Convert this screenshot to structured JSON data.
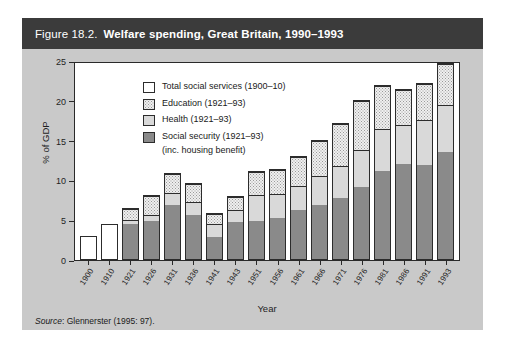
{
  "figure": {
    "number": "Figure 18.2.",
    "title": "Welfare spending, Great Britain, 1990–1993",
    "source_label": "Source",
    "source_text": ": Glennerster (1995: 97)."
  },
  "legend": {
    "items": [
      {
        "key": "total",
        "label": "Total social services (1900–10)"
      },
      {
        "key": "education",
        "label": "Education (1921–93)"
      },
      {
        "key": "health",
        "label": "Health (1921–93)"
      },
      {
        "key": "social",
        "label": "Social security (1921–93)"
      }
    ],
    "social_sub": "(inc. housing benefit)"
  },
  "colors": {
    "header_bar": "#3b3b3b",
    "figure_background": "#c9c9c9",
    "plot_background": "#ffffff",
    "social_security": "#8a8a8a",
    "health": "#d9d9d9",
    "education": "#efefef",
    "total_social_services": "#ffffff",
    "axis": "#2a2a2a"
  },
  "chart_data": {
    "type": "bar",
    "title": "Welfare spending, Great Britain, 1990–1993",
    "subtitle": "",
    "xlabel": "Year",
    "ylabel": "% of GDP",
    "ylim": [
      0,
      25
    ],
    "yticks": [
      0,
      5,
      10,
      15,
      20,
      25
    ],
    "grid": false,
    "stacked": true,
    "legend_position": "top-left inside plot",
    "categories": [
      "1900",
      "1910",
      "1921",
      "1926",
      "1931",
      "1936",
      "1941",
      "1943",
      "1951",
      "1956",
      "1961",
      "1966",
      "1971",
      "1976",
      "1981",
      "1986",
      "1991",
      "1993"
    ],
    "series": [
      {
        "name": "Social security (1921–93) (inc. housing benefit)",
        "values": [
          null,
          null,
          4.4,
          4.8,
          6.8,
          5.6,
          2.8,
          4.7,
          4.8,
          5.2,
          6.2,
          6.8,
          7.8,
          9.1,
          11.2,
          12.0,
          11.9,
          13.6
        ]
      },
      {
        "name": "Health (1921–93)",
        "values": [
          null,
          null,
          5.0,
          5.6,
          8.4,
          7.2,
          4.4,
          6.2,
          8.1,
          8.3,
          9.3,
          10.5,
          11.8,
          13.8,
          16.5,
          17.0,
          17.6,
          19.6
        ]
      },
      {
        "name": "Education (1921–93)",
        "values": [
          null,
          null,
          6.3,
          8.0,
          10.8,
          9.5,
          5.7,
          7.9,
          11.0,
          11.3,
          13.0,
          15.0,
          17.1,
          20.0,
          21.9,
          21.5,
          22.2,
          24.7
        ]
      },
      {
        "name": "Total social services (1900–10)",
        "values": [
          2.8,
          4.3,
          null,
          null,
          null,
          null,
          null,
          null,
          null,
          null,
          null,
          null,
          null,
          null,
          null,
          null,
          null,
          null
        ]
      }
    ],
    "cumulative_tops": {
      "note": "Series values are cumulative stack tops; segment height = top minus previous top.",
      "order": [
        "social",
        "health",
        "education"
      ]
    }
  }
}
